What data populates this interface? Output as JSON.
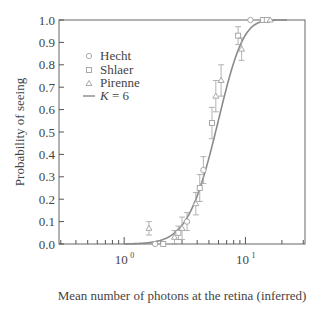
{
  "chart_data": {
    "type": "scatter",
    "title": "",
    "xlabel": "Mean number of photons at the retina (inferred)",
    "ylabel": "Probability of seeing",
    "xscale": "log",
    "xlim": [
      0.29,
      31
    ],
    "ylim": [
      0.0,
      1.0
    ],
    "x_ticks": [
      {
        "value": 1,
        "label": "10",
        "exp": "0"
      },
      {
        "value": 10,
        "label": "10",
        "exp": "1"
      }
    ],
    "y_ticks": [
      "0.0",
      "0.1",
      "0.2",
      "0.3",
      "0.4",
      "0.5",
      "0.6",
      "0.7",
      "0.8",
      "0.9",
      "1.0"
    ],
    "grid": false,
    "legend_position": "upper left",
    "series": [
      {
        "name": "Hecht",
        "marker": "circle",
        "points": [
          {
            "x": 1.8,
            "y": 0.0
          },
          {
            "x": 3.3,
            "y": 0.1,
            "err": 0.04
          },
          {
            "x": 4.5,
            "y": 0.33,
            "err": 0.06
          },
          {
            "x": 11.0,
            "y": 1.0
          }
        ]
      },
      {
        "name": "Shlaer",
        "marker": "square",
        "points": [
          {
            "x": 2.1,
            "y": 0.0
          },
          {
            "x": 2.8,
            "y": 0.05,
            "err": 0.03
          },
          {
            "x": 4.2,
            "y": 0.25,
            "err": 0.06
          },
          {
            "x": 5.3,
            "y": 0.54,
            "err": 0.07
          },
          {
            "x": 8.7,
            "y": 0.93,
            "err": 0.04
          },
          {
            "x": 14.0,
            "y": 1.0
          },
          {
            "x": 15.0,
            "y": 1.0
          }
        ]
      },
      {
        "name": "Pirenne",
        "marker": "triangle",
        "points": [
          {
            "x": 1.6,
            "y": 0.07,
            "err": 0.03
          },
          {
            "x": 2.6,
            "y": 0.03,
            "err": 0.03
          },
          {
            "x": 3.0,
            "y": 0.07,
            "err": 0.05
          },
          {
            "x": 3.9,
            "y": 0.18,
            "err": 0.05
          },
          {
            "x": 5.7,
            "y": 0.66,
            "err": 0.07
          },
          {
            "x": 6.3,
            "y": 0.73,
            "err": 0.07
          },
          {
            "x": 9.3,
            "y": 0.87,
            "err": 0.05
          },
          {
            "x": 16.0,
            "y": 1.0
          }
        ]
      },
      {
        "name": "K = 6",
        "type": "line",
        "model": "Poisson cumulative P(n >= K), K = 6, scaled mean",
        "K": 6
      }
    ]
  },
  "legend": {
    "items": [
      {
        "label": "Hecht",
        "marker": "circle"
      },
      {
        "label": "Shlaer",
        "marker": "square"
      },
      {
        "label": "Pirenne",
        "marker": "triangle"
      },
      {
        "label_k": "K",
        "label_rest": " = 6",
        "marker": "line"
      }
    ]
  },
  "colors": {
    "axis": "#555555",
    "curve": "#8a8a8a",
    "markers": "#a0a0a0",
    "text": "#444444"
  }
}
